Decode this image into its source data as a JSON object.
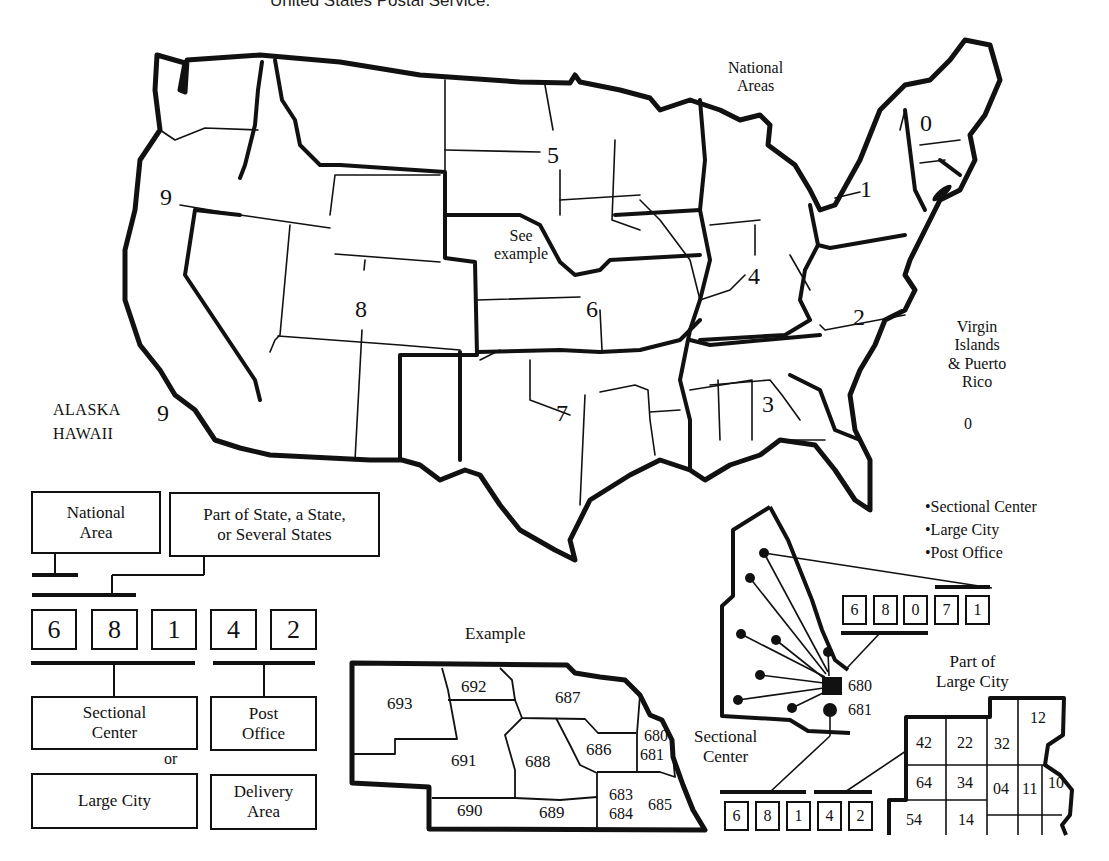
{
  "caption": "United States Postal Service.",
  "map": {
    "national_areas_title": "National\nAreas",
    "zone_labels": [
      {
        "id": "zone-0",
        "label": "0"
      },
      {
        "id": "zone-1",
        "label": "1"
      },
      {
        "id": "zone-2",
        "label": "2"
      },
      {
        "id": "zone-3",
        "label": "3"
      },
      {
        "id": "zone-4",
        "label": "4"
      },
      {
        "id": "zone-5",
        "label": "5"
      },
      {
        "id": "zone-6",
        "label": "6"
      },
      {
        "id": "zone-7",
        "label": "7"
      },
      {
        "id": "zone-8",
        "label": "8"
      },
      {
        "id": "zone-9",
        "label": "9"
      }
    ],
    "see_example": "See\nexample",
    "alaska_hawaii": {
      "label": "ALASKA\nHAWAII",
      "zone": "9"
    },
    "virgin_islands": {
      "label": "Virgin\nIslands\n& Puerto\nRico",
      "zone": "0"
    }
  },
  "zip_breakdown": {
    "national_area_box": "National\nArea",
    "state_box": "Part of State, a State,\nor Several States",
    "digits": [
      "6",
      "8",
      "1",
      "4",
      "2"
    ],
    "sectional_center_box": "Sectional\nCenter",
    "or_label": "or",
    "large_city_box": "Large City",
    "post_office_box": "Post\nOffice",
    "delivery_area_box": "Delivery\nArea"
  },
  "example": {
    "title": "Example",
    "regions": [
      "693",
      "692",
      "687",
      "691",
      "688",
      "686",
      "680",
      "681",
      "690",
      "689",
      "683",
      "684",
      "685"
    ]
  },
  "sectional_center_detail": {
    "legend": [
      "•Sectional Center",
      "•Large City",
      "•Post Office"
    ],
    "top_zip_digits": [
      "6",
      "8",
      "0",
      "7",
      "1"
    ],
    "center_codes": [
      "680",
      "681"
    ],
    "label": "Sectional\nCenter",
    "bottom_zip_digits": [
      "6",
      "8",
      "1",
      "4",
      "2"
    ]
  },
  "large_city_detail": {
    "title": "Part of\nLarge City",
    "delivery_areas": [
      "42",
      "22",
      "32",
      "12",
      "64",
      "34",
      "04",
      "11",
      "10",
      "54",
      "14"
    ]
  }
}
